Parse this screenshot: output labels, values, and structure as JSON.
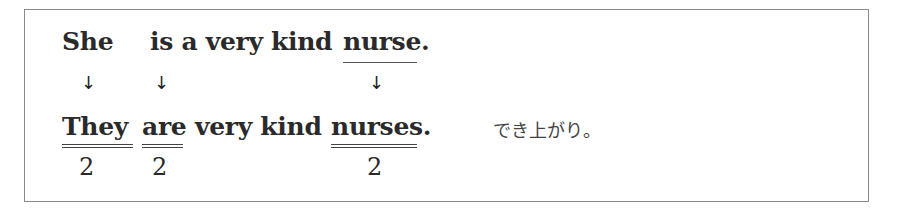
{
  "line1": {
    "subject": "She",
    "rest": "is a very kind",
    "noun": "nurse."
  },
  "arrows": {
    "a1": "↓",
    "a2": "↓",
    "a3": "↓"
  },
  "line2": {
    "subject": "They",
    "verb": "are",
    "middle": "very kind",
    "noun": "nurses."
  },
  "numbers": {
    "n1": "2",
    "n2": "2",
    "n3": "2"
  },
  "note": "でき上がり。"
}
